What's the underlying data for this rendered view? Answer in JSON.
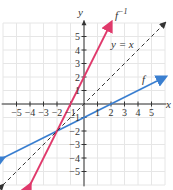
{
  "chart_data": {
    "type": "line",
    "title": "",
    "xlabel": "x",
    "ylabel": "y",
    "xlim": [
      -6,
      6
    ],
    "ylim": [
      -6,
      6
    ],
    "grid": true,
    "x_ticks": [
      -5,
      -4,
      -3,
      -2,
      -1,
      1,
      2,
      3,
      4,
      5
    ],
    "y_ticks": [
      -5,
      -4,
      -3,
      -2,
      -1,
      1,
      2,
      3,
      4,
      5
    ],
    "series": [
      {
        "name": "f",
        "equation": "y = x/2 - 1",
        "color": "#3a7fd0",
        "style": "solid",
        "points": [
          [
            -6,
            -4
          ],
          [
            6,
            2
          ]
        ]
      },
      {
        "name": "f^{-1}",
        "equation": "y = 2x + 2",
        "color": "#e0396b",
        "style": "solid",
        "points": [
          [
            -4,
            -6
          ],
          [
            2,
            6
          ]
        ]
      },
      {
        "name": "y = x",
        "equation": "y = x",
        "color": "#333333",
        "style": "dashed",
        "points": [
          [
            -6,
            -6
          ],
          [
            6,
            6
          ]
        ]
      }
    ],
    "annotations": [
      "f^{-1}",
      "y = x",
      "f"
    ]
  },
  "labels": {
    "x_axis": "x",
    "y_axis": "y",
    "f": "f",
    "finv_base": "f",
    "finv_sup": "−1",
    "yx": "y = x"
  }
}
